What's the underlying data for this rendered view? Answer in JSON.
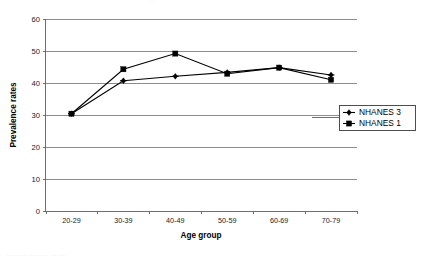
{
  "chart_data": {
    "type": "line",
    "title": "",
    "xlabel": "Age group",
    "ylabel": "Prevalence rates",
    "categories": [
      "20-29",
      "30-39",
      "40-49",
      "50-59",
      "60-69",
      "70-79"
    ],
    "ylim": [
      0,
      60
    ],
    "yticks": [
      0,
      10,
      20,
      30,
      40,
      50,
      60
    ],
    "ytick_labels": [
      "0",
      "10",
      "20",
      "30",
      "40",
      "50",
      "60"
    ],
    "grid": true,
    "legend_position": "right",
    "series": [
      {
        "name": "NHANES 3",
        "marker": "diamond",
        "color": "#000000",
        "values": [
          30.4,
          40.7,
          42.1,
          43.3,
          44.8,
          42.5
        ]
      },
      {
        "name": "NHANES 1",
        "marker": "square",
        "color": "#000000",
        "values": [
          30.4,
          44.3,
          49.2,
          42.9,
          44.8,
          41.0
        ]
      }
    ]
  },
  "legend": {
    "items": [
      {
        "label": "NHANES 3",
        "marker": "diamond-marker"
      },
      {
        "label": "NHANES 1",
        "marker": "square-marker"
      }
    ]
  },
  "fragments": {
    "top_clipped_text": "··",
    "bottom_clipped_caption": "— —— ——— — —"
  }
}
